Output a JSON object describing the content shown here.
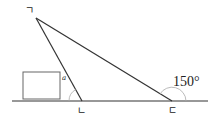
{
  "diagram": {
    "vertices": [
      {
        "id": "top",
        "label": "ㄱ",
        "x": 36,
        "y": 18
      },
      {
        "id": "middle",
        "label": "ㄴ",
        "x": 82,
        "y": 101
      },
      {
        "id": "right",
        "label": "ㄷ",
        "x": 172,
        "y": 101
      }
    ],
    "angle_at_middle_label": "a",
    "exterior_angle_at_right_label": "150°",
    "answer_box": "",
    "colors": {
      "line": "#333333",
      "arc": "#aaaaaa",
      "box": "#666666"
    }
  }
}
